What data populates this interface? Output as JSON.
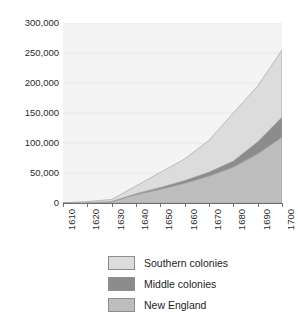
{
  "chart_data": {
    "type": "area",
    "stacked": true,
    "title": "",
    "subtitle": "",
    "xlabel": "",
    "ylabel": "",
    "x": [
      1610,
      1620,
      1630,
      1640,
      1650,
      1660,
      1670,
      1680,
      1690,
      1700
    ],
    "categories": [
      "1610",
      "1620",
      "1630",
      "1640",
      "1650",
      "1660",
      "1670",
      "1680",
      "1690",
      "1700"
    ],
    "xlim": [
      1610,
      1700
    ],
    "ylim": [
      0,
      300000
    ],
    "yticks": [
      0,
      50000,
      100000,
      150000,
      200000,
      250000,
      300000
    ],
    "ytick_labels": [
      "0",
      "50,000",
      "100,000",
      "150,000",
      "200,000",
      "250,000",
      "300,000"
    ],
    "xtick_labels": [
      "1610",
      "1620",
      "1630",
      "1640",
      "1650",
      "1660",
      "1670",
      "1680",
      "1690",
      "1700"
    ],
    "grid": true,
    "grid_axis": "y",
    "legend_position": "bottom",
    "series": [
      {
        "name": "New England",
        "color": "#bdbdbd",
        "values": [
          0,
          500,
          2000,
          14000,
          23000,
          33000,
          45000,
          60000,
          82000,
          110000
        ]
      },
      {
        "name": "Middle colonies",
        "color": "#8c8c8c",
        "values": [
          0,
          0,
          400,
          1500,
          3000,
          4500,
          6500,
          10000,
          20000,
          33000
        ]
      },
      {
        "name": "Southern colonies",
        "color": "#dcdcdc",
        "values": [
          500,
          2000,
          3500,
          13000,
          25000,
          36000,
          53000,
          80000,
          93000,
          112000
        ]
      }
    ],
    "stack_order_bottom_to_top": [
      "New England",
      "Middle colonies",
      "Southern colonies"
    ],
    "totals": [
      500,
      2500,
      5900,
      28500,
      51000,
      73500,
      104500,
      150000,
      195000,
      255000
    ]
  },
  "legend": {
    "items": [
      {
        "label": "Southern colonies",
        "color": "#dcdcdc"
      },
      {
        "label": "Middle colonies",
        "color": "#8c8c8c"
      },
      {
        "label": "New England",
        "color": "#bdbdbd"
      }
    ]
  },
  "colors": {
    "plot_background": "#f4f4f4",
    "gridline": "#e8e8e8",
    "axis": "#6e6e6e",
    "text": "#2b2b2b",
    "series_border": "#9a9a9a"
  }
}
